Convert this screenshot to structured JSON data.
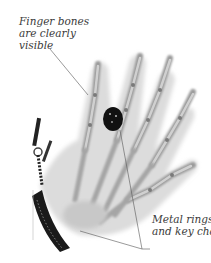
{
  "figure": {
    "annotations": [
      {
        "lines": [
          "Finger bones",
          "are clearly",
          "visible"
        ]
      },
      {
        "lines": [
          "Metal rings",
          "and key chain"
        ]
      }
    ]
  },
  "colors": {
    "background": "#ffffff",
    "label_text": "#3a3a3a",
    "leader_line": "#555555",
    "bone_light": "#d9d9d9",
    "bone_dark": "#8a8a8a",
    "metal": "#111111"
  }
}
